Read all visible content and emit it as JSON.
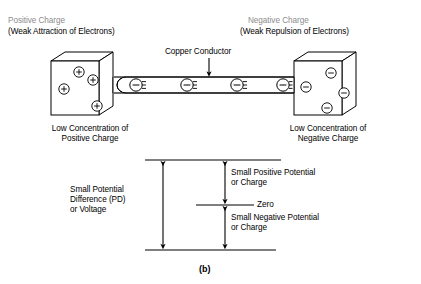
{
  "figure": {
    "caption": "(b)",
    "labels": {
      "positive_charge_title": "Positive Charge",
      "positive_charge_sub": "(Weak Attraction of Electrons)",
      "negative_charge_title": "Negative Charge",
      "negative_charge_sub": "(Weak Repulsion of Electrons)",
      "copper_conductor": "Copper Conductor",
      "low_conc_positive": "Low Concentration of\nPositive Charge",
      "low_conc_negative": "Low Concentration of\nNegative Charge",
      "potential_difference": "Small Potential\nDifference (PD)\nor Voltage",
      "small_positive_potential": "Small Positive Potential\nor Charge",
      "small_negative_potential": "Small Negative Potential\nor Charge",
      "zero": "Zero"
    },
    "left_cube": {
      "charge_symbol": "+",
      "charge_count": 4,
      "charges": [
        {
          "cx": 79,
          "cy": 72
        },
        {
          "cx": 93,
          "cy": 80
        },
        {
          "cx": 64,
          "cy": 89
        },
        {
          "cx": 97,
          "cy": 106
        }
      ]
    },
    "right_cube": {
      "charge_symbol": "−",
      "charge_count": 4,
      "charges": [
        {
          "cx": 331,
          "cy": 73
        },
        {
          "cx": 306,
          "cy": 87
        },
        {
          "cx": 344,
          "cy": 93
        },
        {
          "cx": 327,
          "cy": 108
        }
      ]
    },
    "conductor": {
      "electron_symbol": "−",
      "electron_count": 4,
      "electrons": [
        {
          "cx": 136,
          "cy": 85
        },
        {
          "cx": 187,
          "cy": 85
        },
        {
          "cx": 237,
          "cy": 85
        },
        {
          "cx": 283,
          "cy": 85
        }
      ]
    },
    "colors": {
      "stroke": "#000000",
      "title_gray": "#8c8c8c",
      "background": "#ffffff"
    }
  }
}
